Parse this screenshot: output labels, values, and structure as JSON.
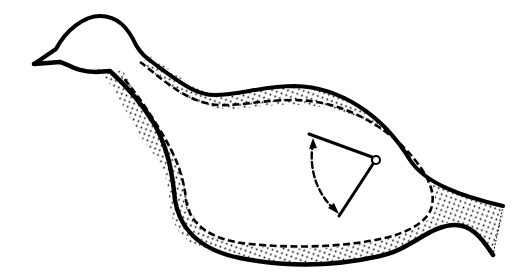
{
  "diagram": {
    "subject": "bird-shaped body outline",
    "layers": [
      {
        "name": "outer-wall",
        "style": "thick solid black outline"
      },
      {
        "name": "stippled-wall-layer",
        "style": "dotted fill between outer and inner boundary"
      },
      {
        "name": "inner-boundary",
        "style": "dashed line"
      }
    ],
    "indicator": {
      "name": "rotating-lever",
      "pivot": "small open circle",
      "arms": 2,
      "arc": "dashed curved double-headed arrow between arm tips"
    },
    "colors": {
      "stroke": "#000000",
      "background": "#ffffff",
      "stipple": "#000000"
    }
  }
}
